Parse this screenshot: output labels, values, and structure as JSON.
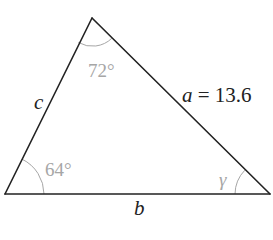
{
  "diagram": {
    "type": "triangle",
    "vertices": {
      "top": [
        92,
        18
      ],
      "bottom_left": [
        5,
        194
      ],
      "bottom_right": [
        270,
        194
      ]
    },
    "colors": {
      "edge": "#222222",
      "angle_mark": "#a6a6a6",
      "background": "#ffffff"
    },
    "sides": {
      "a": {
        "name": "a",
        "equals": "=",
        "value": "13.6"
      },
      "b": {
        "name": "b"
      },
      "c": {
        "name": "c"
      }
    },
    "angles": {
      "top": "72°",
      "bottom_left": "64°",
      "bottom_right": "γ"
    }
  }
}
